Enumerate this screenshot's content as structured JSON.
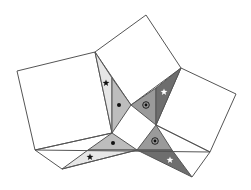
{
  "diagram": {
    "colors": {
      "stroke": "#555555",
      "white": "#ffffff",
      "light": "#e6e6e6",
      "medium": "#bdbdbd",
      "mid_dark": "#9a9a9a",
      "dark": "#6e6e6e",
      "mark_black": "#111111",
      "mark_white": "#ffffff"
    },
    "squares": [
      {
        "name": "left-square",
        "points": "17,71 95,52 112,133 35,150"
      },
      {
        "name": "top-square",
        "points": "95,52 146,15 181,68 131,105"
      },
      {
        "name": "right-square",
        "points": "181,68 236,94 210,152 156,125"
      }
    ],
    "triangles": [
      {
        "name": "left-star-triangle",
        "points": "95,52 112,78 112,133",
        "fill": "light",
        "mark": "star-black",
        "mx": 106,
        "my": 83
      },
      {
        "name": "left-dot-triangle",
        "points": "112,78 131,105 112,133",
        "fill": "medium",
        "mark": "dot",
        "mx": 119,
        "my": 105
      },
      {
        "name": "upper-circle-dot-triangle",
        "points": "131,105 156,88 156,125",
        "fill": "mid_dark",
        "mark": "circle-dot",
        "mx": 146,
        "my": 105
      },
      {
        "name": "upper-white-star-triangle",
        "points": "156,88 181,68 156,125",
        "fill": "dark",
        "mark": "star-white",
        "mx": 164,
        "my": 92
      },
      {
        "name": "bottom-dot-triangle",
        "points": "88,150 112,133 137,150",
        "fill": "medium",
        "mark": "dot",
        "mx": 113,
        "my": 143
      },
      {
        "name": "bottom-star-triangle",
        "points": "62,169 88,150 137,150",
        "fill": "light",
        "mark": "star-black",
        "mx": 90,
        "my": 157
      },
      {
        "name": "lower-circle-dot-triangle",
        "points": "137,150 156,125 172,150",
        "fill": "mid_dark",
        "mark": "circle-dot",
        "mx": 155,
        "my": 141
      },
      {
        "name": "lower-white-star-triangle",
        "points": "137,150 172,150 192,177",
        "fill": "dark",
        "mark": "star-white",
        "mx": 170,
        "my": 160
      }
    ],
    "lines": [
      {
        "name": "horizontal-base-line",
        "x1": 35,
        "y1": 150,
        "x2": 210,
        "y2": 152
      },
      {
        "name": "left-diagonal-line",
        "x1": 35,
        "y1": 150,
        "x2": 112,
        "y2": 133
      },
      {
        "name": "lower-left-edge",
        "x1": 35,
        "y1": 150,
        "x2": 62,
        "y2": 169
      },
      {
        "name": "lower-right-line",
        "x1": 156,
        "y1": 125,
        "x2": 210,
        "y2": 152
      },
      {
        "name": "lower-diagonal-line",
        "x1": 62,
        "y1": 169,
        "x2": 137,
        "y2": 150
      },
      {
        "name": "right-tip-line",
        "x1": 192,
        "y1": 177,
        "x2": 210,
        "y2": 152
      }
    ]
  }
}
